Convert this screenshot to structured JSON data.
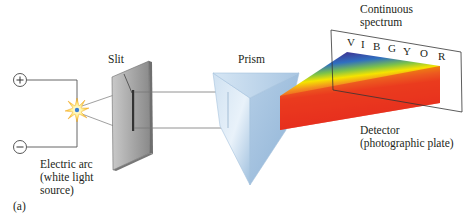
{
  "figure_label": "(a)",
  "labels": {
    "slit": "Slit",
    "prism": "Prism",
    "continuous_spectrum_line1": "Continuous",
    "continuous_spectrum_line2": "spectrum",
    "detector_line1": "Detector",
    "detector_line2": "(photographic plate)",
    "arc_line1": "Electric arc",
    "arc_line2": "(white light",
    "arc_line3": "source)"
  },
  "terminals": {
    "positive": "+",
    "negative": "−"
  },
  "spectrum_letters": [
    "V",
    "I",
    "B",
    "G",
    "Y",
    "O",
    "R"
  ],
  "colors": {
    "violet": "#5b2a86",
    "indigo": "#3b3f9c",
    "blue": "#2f6fc0",
    "green": "#7cc24a",
    "yellow": "#f5e400",
    "orange": "#f39020",
    "red": "#e8281f",
    "prism": "#b9d3ea",
    "slit_plate": "#9a9a9a"
  }
}
